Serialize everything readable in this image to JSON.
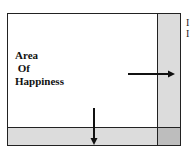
{
  "diagram": {
    "label_lines": [
      "Area",
      " Of",
      "Happiness"
    ],
    "cut_text": [
      "I",
      "I"
    ],
    "colors": {
      "strip": "#dcdcdc",
      "corner": "#bdbdbd",
      "border": "#222222"
    },
    "arrows": [
      {
        "direction": "right",
        "from": [
          128,
          74
        ],
        "to": [
          175,
          74
        ]
      },
      {
        "direction": "down",
        "from": [
          94,
          108
        ],
        "to": [
          94,
          145
        ]
      }
    ]
  }
}
